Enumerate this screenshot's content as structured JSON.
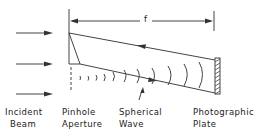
{
  "diagram": {
    "type": "pinhole-hologram-setup",
    "dimension_label": "f",
    "colors": {
      "line": "#333333",
      "background": "#ffffff"
    },
    "labels": {
      "incident_beam": [
        "Incident",
        "Beam"
      ],
      "pinhole_aperture": [
        "Pinhole",
        "Aperture"
      ],
      "spherical_wave": [
        "Spherical",
        "Wave"
      ],
      "photographic_plate": [
        "Photographic",
        "Plate"
      ]
    },
    "components": [
      {
        "name": "incident-beam",
        "arrows": 3
      },
      {
        "name": "pinhole-aperture"
      },
      {
        "name": "spherical-wave",
        "arcs": 9
      },
      {
        "name": "photographic-plate",
        "hatched": true
      }
    ]
  }
}
